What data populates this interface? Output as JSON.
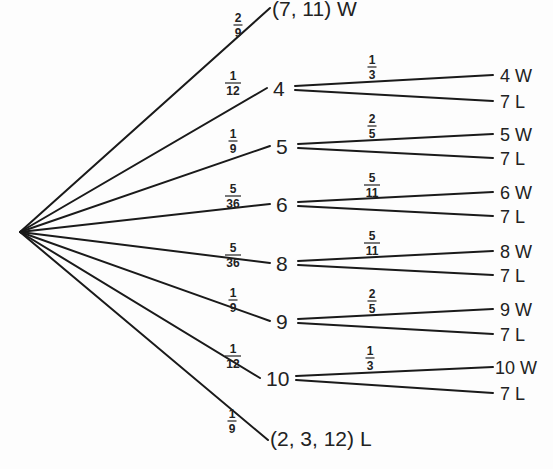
{
  "diagram": {
    "type": "probability-tree",
    "root": {
      "x": 20,
      "y": 232
    },
    "terminal_first_roll": [
      {
        "id": "natural",
        "label": "(7, 11) W",
        "prob": {
          "num": "2",
          "den": "9"
        },
        "end": {
          "x": 270,
          "y": 2
        },
        "prob_pos": {
          "x": 238,
          "y": 22
        }
      },
      {
        "id": "craps",
        "label": "(2, 3, 12) L",
        "prob": {
          "num": "1",
          "den": "9"
        },
        "end": {
          "x": 268,
          "y": 440
        },
        "prob_pos": {
          "x": 232,
          "y": 418
        }
      }
    ],
    "points": [
      {
        "point": "4",
        "prob": {
          "num": "1",
          "den": "12"
        },
        "node": {
          "x": 275,
          "y": 88
        },
        "prob_pos": {
          "x": 233,
          "y": 80
        },
        "sub_prob": {
          "num": "1",
          "den": "3"
        },
        "sub_prob_pos": {
          "x": 372,
          "y": 64
        },
        "win_label": "4 W",
        "lose_label": "7 L",
        "win_y": 75,
        "lose_y": 101
      },
      {
        "point": "5",
        "prob": {
          "num": "1",
          "den": "9"
        },
        "node": {
          "x": 278,
          "y": 146
        },
        "prob_pos": {
          "x": 233,
          "y": 138
        },
        "sub_prob": {
          "num": "2",
          "den": "5"
        },
        "sub_prob_pos": {
          "x": 372,
          "y": 123
        },
        "win_label": "5 W",
        "lose_label": "7 L",
        "win_y": 134,
        "lose_y": 158
      },
      {
        "point": "6",
        "prob": {
          "num": "5",
          "den": "36"
        },
        "node": {
          "x": 278,
          "y": 204
        },
        "prob_pos": {
          "x": 233,
          "y": 193
        },
        "sub_prob": {
          "num": "5",
          "den": "11"
        },
        "sub_prob_pos": {
          "x": 372,
          "y": 182
        },
        "win_label": "6 W",
        "lose_label": "7 L",
        "win_y": 192,
        "lose_y": 216
      },
      {
        "point": "8",
        "prob": {
          "num": "5",
          "den": "36"
        },
        "node": {
          "x": 278,
          "y": 263
        },
        "prob_pos": {
          "x": 233,
          "y": 252
        },
        "sub_prob": {
          "num": "5",
          "den": "11"
        },
        "sub_prob_pos": {
          "x": 372,
          "y": 240
        },
        "win_label": "8 W",
        "lose_label": "7 L",
        "win_y": 251,
        "lose_y": 275
      },
      {
        "point": "9",
        "prob": {
          "num": "1",
          "den": "9"
        },
        "node": {
          "x": 278,
          "y": 321
        },
        "prob_pos": {
          "x": 233,
          "y": 297
        },
        "sub_prob": {
          "num": "2",
          "den": "5"
        },
        "sub_prob_pos": {
          "x": 372,
          "y": 298
        },
        "win_label": "9 W",
        "lose_label": "7 L",
        "win_y": 309,
        "lose_y": 334
      },
      {
        "point": "10",
        "prob": {
          "num": "1",
          "den": "12"
        },
        "node": {
          "x": 268,
          "y": 378
        },
        "prob_pos": {
          "x": 233,
          "y": 353
        },
        "sub_prob": {
          "num": "1",
          "den": "3"
        },
        "sub_prob_pos": {
          "x": 370,
          "y": 355
        },
        "win_label": "10 W",
        "lose_label": "7 L",
        "win_y": 367,
        "lose_y": 393
      }
    ]
  },
  "text": {
    "natural_label": "(7, 11) W",
    "craps_label": "(2, 3, 12) L",
    "natural_prob": "2/9",
    "craps_prob": "1/9"
  }
}
